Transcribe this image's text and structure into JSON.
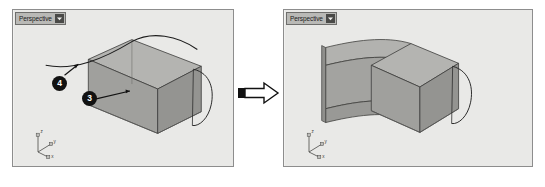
{
  "figure": {
    "caption": "",
    "background_color": "#ffffff",
    "progression_arrow": {
      "icon": "right-arrow-icon",
      "direction": "right",
      "fill_color": "#ffffff",
      "stroke_color": "#111111"
    }
  },
  "panels": [
    {
      "id": "before",
      "title": "Perspective",
      "caret_icon": "chevron-down-icon",
      "background_color": "#e9e9e7",
      "border_color": "#8d8d8d",
      "axis_gizmo": {
        "name": "axis-gizmo",
        "labels": [
          "z",
          "y",
          "x"
        ]
      },
      "callouts": [
        {
          "label": "4",
          "target": "curve"
        },
        {
          "label": "3",
          "target": "box-edge"
        }
      ],
      "objects": [
        {
          "name": "box",
          "type": "solid-box",
          "fill": "#9d9d9b"
        },
        {
          "name": "sweep-rail-curve",
          "type": "curve",
          "stroke": "#1d1d1d"
        },
        {
          "name": "profile-loop-curve",
          "type": "curve",
          "stroke": "#2b2b2b"
        }
      ]
    },
    {
      "id": "after",
      "title": "Perspective",
      "caret_icon": "chevron-down-icon",
      "background_color": "#e9e9e7",
      "border_color": "#8d8d8d",
      "axis_gizmo": {
        "name": "axis-gizmo",
        "labels": [
          "z",
          "y",
          "x"
        ]
      },
      "callouts": [],
      "objects": [
        {
          "name": "box",
          "type": "solid-box",
          "fill": "#9d9d9b"
        },
        {
          "name": "swept-surface",
          "type": "sweep",
          "fill": "#a6a6a3"
        },
        {
          "name": "profile-loop-curve",
          "type": "curve",
          "stroke": "#2b2b2b"
        }
      ]
    }
  ]
}
